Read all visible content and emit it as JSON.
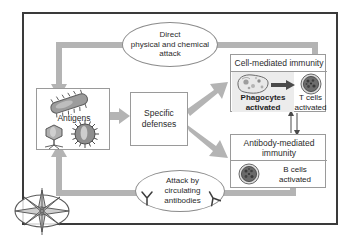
{
  "diagram": {
    "frame_color": "#3a3a3a",
    "pipe_color": "#b4b4b4",
    "panel_color": "#ececec"
  },
  "nodes": {
    "antigens": {
      "label": "Antigens"
    },
    "specific_defenses": {
      "line1": "Specific",
      "line2": "defenses"
    },
    "cell_mediated": {
      "header": "Cell-mediated immunity",
      "phagocytes_line1": "Phagocytes",
      "phagocytes_line2": "activated",
      "tcells_line1": "T cells",
      "tcells_line2": "activated"
    },
    "antibody_mediated": {
      "header_line1": "Antibody-mediated",
      "header_line2": "immunity",
      "bcells_line1": "B cells",
      "bcells_line2": "activated"
    }
  },
  "callouts": {
    "direct_attack": {
      "line1": "Direct",
      "line2": "physical and chemical",
      "line3": "attack"
    },
    "antibody_attack": {
      "line1": "Attack by",
      "line2": "circulating",
      "line3": "antibodies"
    }
  },
  "icons": {
    "bacterium": "bacterium-icon",
    "bacteriophage": "bacteriophage-icon",
    "virus": "virus-icon",
    "phagocyte": "phagocyte-cell-icon",
    "tcell": "t-cell-icon",
    "bcell": "b-cell-icon",
    "antibody_left": "antibody-y-icon",
    "antibody_right": "antibody-y-icon",
    "compass": "compass-rose-icon"
  }
}
